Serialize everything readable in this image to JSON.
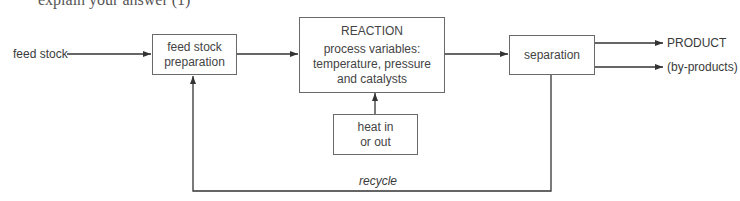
{
  "header": {
    "cut_off_text": "explain your answer (1)"
  },
  "diagram": {
    "input_label": "feed stock",
    "boxes": {
      "preparation": {
        "line1": "feed stock",
        "line2": "preparation"
      },
      "reaction": {
        "title": "REACTION",
        "line1": "process variables:",
        "line2": "temperature, pressure",
        "line3": "and catalysts"
      },
      "heat": {
        "line1": "heat in",
        "line2": "or out"
      },
      "separation": {
        "label": "separation"
      }
    },
    "outputs": {
      "product": "PRODUCT",
      "byproducts": "(by-products)"
    },
    "recycle_label": "recycle"
  }
}
